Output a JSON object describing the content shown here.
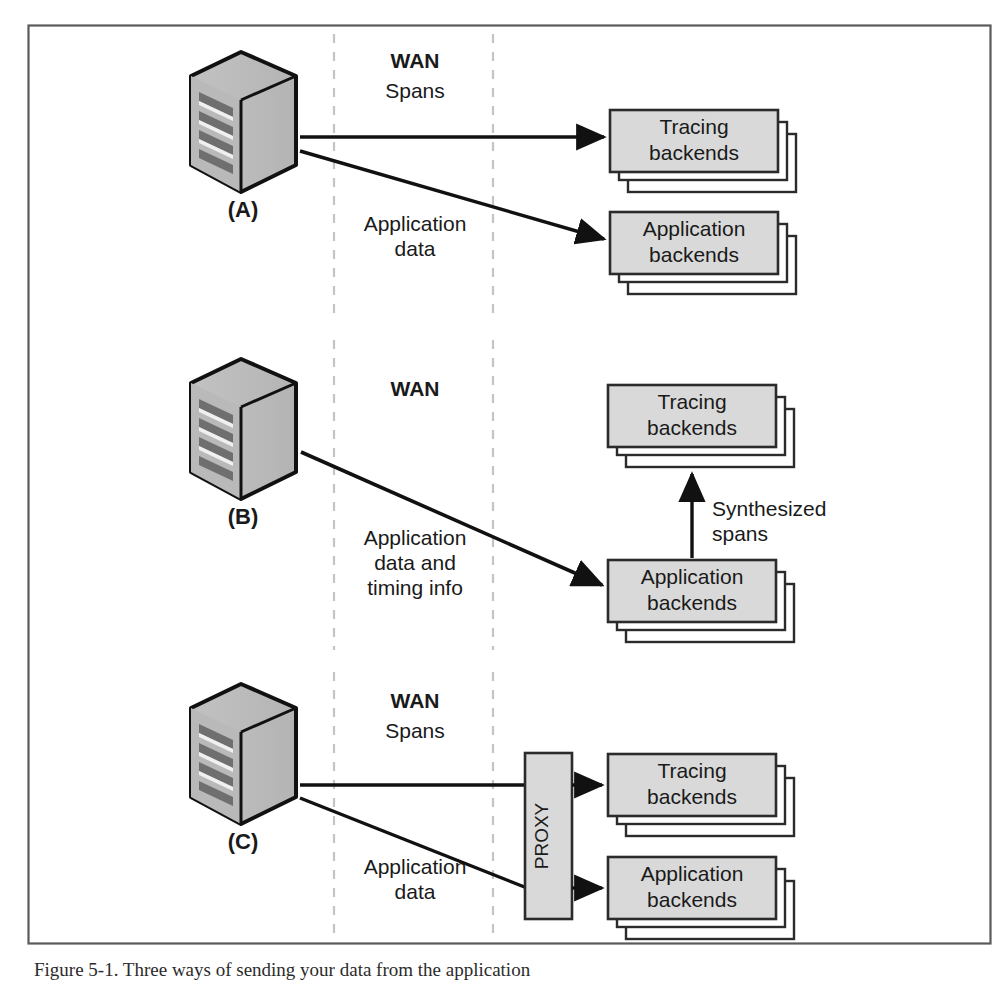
{
  "figure": {
    "caption": "Figure 5-1. Three ways of sending your data from the application",
    "frame": {
      "border_color": "#4a4a4a"
    },
    "colors": {
      "box_fill": "#d9d9d9",
      "box_stroke": "#2b2b2b",
      "server_fill": "#c6c6c6",
      "server_shadow": "#ababab",
      "arrow": "#111111",
      "wan_divider": "#bdbdbd",
      "text": "#1a1a1a"
    },
    "wan_divider_label": "WAN",
    "sections": [
      {
        "id": "A",
        "server_label": "(A)",
        "wan_title": "WAN",
        "wan_subtitle": "Spans",
        "edges": [
          {
            "label": "",
            "from": "server-a",
            "to": "tracing-backends-a"
          },
          {
            "label": "Application\ndata",
            "label_line1": "Application",
            "label_line2": "data",
            "from": "server-a",
            "to": "application-backends-a"
          }
        ],
        "boxes": [
          {
            "id": "tracing-backends-a",
            "line1": "Tracing",
            "line2": "backends",
            "stacked": 3
          },
          {
            "id": "application-backends-a",
            "line1": "Application",
            "line2": "backends",
            "stacked": 3
          }
        ]
      },
      {
        "id": "B",
        "server_label": "(B)",
        "wan_title": "WAN",
        "wan_subtitle": "",
        "edges": [
          {
            "label_line1": "Application",
            "label_line2": "data and",
            "label_line3": "timing info",
            "from": "server-b",
            "to": "application-backends-b"
          },
          {
            "label_line1": "Synthesized",
            "label_line2": "spans",
            "from": "application-backends-b",
            "to": "tracing-backends-b"
          }
        ],
        "boxes": [
          {
            "id": "tracing-backends-b",
            "line1": "Tracing",
            "line2": "backends",
            "stacked": 3
          },
          {
            "id": "application-backends-b",
            "line1": "Application",
            "line2": "backends",
            "stacked": 3
          }
        ]
      },
      {
        "id": "C",
        "server_label": "(C)",
        "wan_title": "WAN",
        "wan_subtitle": "Spans",
        "proxy_label": "PROXY",
        "edges": [
          {
            "label": "",
            "from": "server-c",
            "to": "proxy-c"
          },
          {
            "label_line1": "Application",
            "label_line2": "data",
            "from": "server-c",
            "to": "proxy-c"
          },
          {
            "label": "",
            "from": "proxy-c",
            "to": "tracing-backends-c"
          },
          {
            "label": "",
            "from": "proxy-c",
            "to": "application-backends-c"
          }
        ],
        "boxes": [
          {
            "id": "tracing-backends-c",
            "line1": "Tracing",
            "line2": "backends",
            "stacked": 3
          },
          {
            "id": "application-backends-c",
            "line1": "Application",
            "line2": "backends",
            "stacked": 3
          }
        ]
      }
    ]
  }
}
